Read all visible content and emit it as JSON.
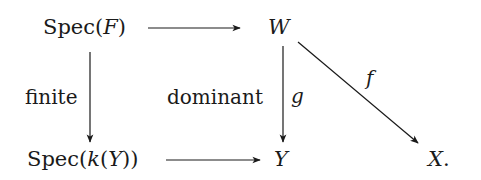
{
  "diagram": {
    "type": "commutative-diagram",
    "nodes": {
      "spec_f": {
        "prefix": "Spec(",
        "var": "F",
        "suffix": ")"
      },
      "w": {
        "var": "W"
      },
      "spec_ky": {
        "prefix": "Spec(",
        "var1": "k",
        "mid": "(",
        "var2": "Y",
        "suffix": "))"
      },
      "y": {
        "var": "Y"
      },
      "x": {
        "var": "X",
        "suffix": "."
      }
    },
    "edges": [
      {
        "from": "Spec(F)",
        "to": "W",
        "label": ""
      },
      {
        "from": "Spec(F)",
        "to": "Spec(k(Y))",
        "label": "finite"
      },
      {
        "from": "W",
        "to": "Y",
        "label": "g",
        "side_label": "dominant"
      },
      {
        "from": "W",
        "to": "X.",
        "label": "f"
      },
      {
        "from": "Spec(k(Y))",
        "to": "Y",
        "label": ""
      }
    ],
    "labels": {
      "finite": "finite",
      "dominant": "dominant",
      "g": "g",
      "f": "f"
    },
    "colors": {
      "line": "#1a1a1a",
      "background": "#ffffff"
    }
  }
}
